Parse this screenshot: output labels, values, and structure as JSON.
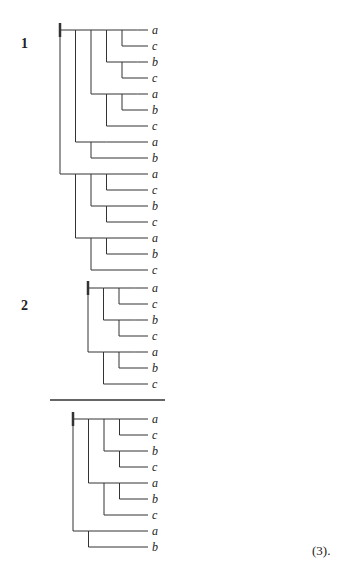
{
  "figure": {
    "labels": {
      "tree1": "1",
      "tree2": "2",
      "equation_number": "(3)."
    },
    "row_spacing_px": 16,
    "trees": [
      {
        "id": "tree1",
        "label": "1",
        "root": {
          "x": 60,
          "y": 30
        },
        "leaf_x": 152,
        "leaves": [
          "a",
          "c",
          "b",
          "c",
          "a",
          "b",
          "c",
          "a",
          "b",
          "a",
          "c",
          "b",
          "c",
          "a",
          "b",
          "c"
        ],
        "structure": "[[[[a,c],[b,c]],[[a,b],c]],[a,b]],[[[a,c],[b,c]],[[a,b],c]]"
      },
      {
        "id": "tree2",
        "label": "2",
        "root": {
          "x": 88,
          "y": 288
        },
        "leaf_x": 152,
        "leaves": [
          "a",
          "c",
          "b",
          "c",
          "a",
          "b",
          "c"
        ],
        "structure": "[[[a,c],[b,c]],[[a,b],c]]"
      },
      {
        "id": "tree3",
        "label": "",
        "root": {
          "x": 73,
          "y": 419
        },
        "leaf_x": 152,
        "leaves": [
          "a",
          "c",
          "b",
          "c",
          "a",
          "b",
          "c",
          "a",
          "b"
        ],
        "structure": "[[[[a,c],[b,c]],[[a,b],c]],[a,b]]"
      }
    ],
    "divider": {
      "x1": 50,
      "x2": 165,
      "y": 400
    }
  }
}
